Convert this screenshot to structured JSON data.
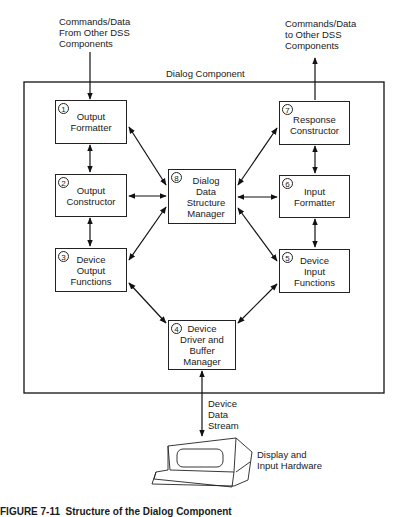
{
  "diagram": {
    "input_label": "Commands/Data\nFrom Other DSS\nComponents",
    "output_label": "Commands/Data\nto Other DSS\nComponents",
    "container_label": "Dialog Component",
    "boxes": [
      {
        "id": "1",
        "label": "Output\nFormatter"
      },
      {
        "id": "2",
        "label": "Output\nConstructor"
      },
      {
        "id": "3",
        "label": "Device\nOutput\nFunctions"
      },
      {
        "id": "4",
        "label": "Device\nDriver and\nBuffer\nManager"
      },
      {
        "id": "5",
        "label": "Device\nInput\nFunctions"
      },
      {
        "id": "6",
        "label": "Input\nFormatter"
      },
      {
        "id": "7",
        "label": "Response\nConstructor"
      },
      {
        "id": "8",
        "label": "Dialog\nData\nStructure\nManager"
      }
    ],
    "stream_label": "Device\nData\nStream",
    "hardware_label": "Display and\nInput Hardware",
    "caption": "FIGURE 7-11  Structure of the Dialog Component"
  }
}
